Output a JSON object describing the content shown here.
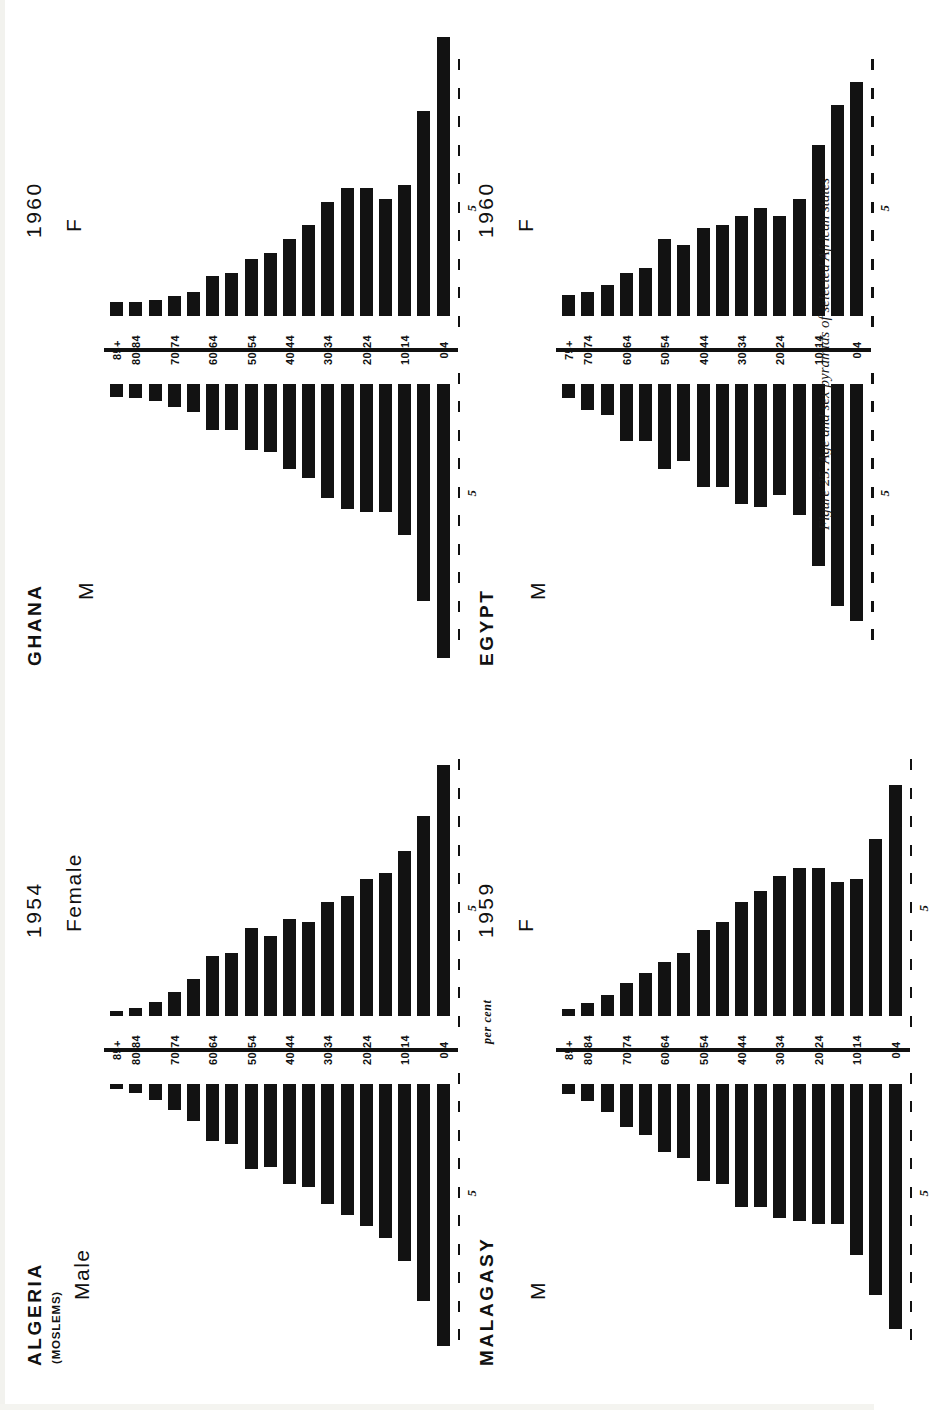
{
  "figure": {
    "caption": "Figure 25.  Age and sex pyramids of selected African states",
    "percent_axis_label": "per cent",
    "tick_label_5": "5"
  },
  "chart_data": [
    {
      "type": "bar",
      "id": "algeria",
      "title": "ALGERIA",
      "subtitle": "(MOSLEMS)",
      "year": "1954",
      "left_sex_label": "Male",
      "right_sex_label": "Female",
      "xlabel": "per cent",
      "ylabel": "",
      "xlim": [
        0,
        10
      ],
      "grid": false,
      "legend": "none",
      "categories": [
        "0-4",
        "5-9",
        "10-14",
        "15-19",
        "20-24",
        "25-29",
        "30-34",
        "35-39",
        "40-44",
        "45-49",
        "50-54",
        "55-59",
        "60-64",
        "65-69",
        "70-74",
        "75-79",
        "80-84",
        "85+"
      ],
      "tick_labels": [
        "0-4",
        "10-14",
        "20-24",
        "30-34",
        "40-44",
        "50-54",
        "60-64",
        "70-74",
        "80-84",
        "85+"
      ],
      "series": [
        {
          "name": "Male",
          "values": [
            9.2,
            7.6,
            6.2,
            5.4,
            5.0,
            4.6,
            4.2,
            3.6,
            3.5,
            2.9,
            3.0,
            2.1,
            2.0,
            1.3,
            0.9,
            0.55,
            0.3,
            0.18
          ]
        },
        {
          "name": "Female",
          "values": [
            8.8,
            7.0,
            5.8,
            5.0,
            4.8,
            4.2,
            4.0,
            3.3,
            3.4,
            2.8,
            3.1,
            2.2,
            2.1,
            1.3,
            0.85,
            0.5,
            0.28,
            0.16
          ]
        }
      ]
    },
    {
      "type": "bar",
      "id": "malagasy",
      "title": "MALAGASY",
      "subtitle": "",
      "year": "1959",
      "left_sex_label": "M",
      "right_sex_label": "F",
      "xlabel": "per cent",
      "ylabel": "",
      "xlim": [
        0,
        10
      ],
      "grid": false,
      "legend": "none",
      "categories": [
        "0-4",
        "5-9",
        "10-14",
        "15-19",
        "20-24",
        "25-29",
        "30-34",
        "35-39",
        "40-44",
        "45-49",
        "50-54",
        "55-59",
        "60-64",
        "65-69",
        "70-74",
        "75-79",
        "80-84",
        "85+"
      ],
      "tick_labels": [
        "0-4",
        "10-14",
        "20-24",
        "30-34",
        "40-44",
        "50-54",
        "60-64",
        "70-74",
        "80-84",
        "85+"
      ],
      "series": [
        {
          "name": "M",
          "values": [
            8.6,
            7.4,
            6.0,
            4.9,
            4.9,
            4.8,
            4.7,
            4.3,
            4.3,
            3.5,
            3.4,
            2.6,
            2.4,
            1.8,
            1.5,
            1.0,
            0.6,
            0.35
          ]
        },
        {
          "name": "F",
          "values": [
            8.1,
            6.2,
            4.8,
            4.7,
            5.2,
            5.2,
            4.9,
            4.4,
            4.0,
            3.3,
            3.0,
            2.2,
            1.9,
            1.5,
            1.15,
            0.75,
            0.45,
            0.25
          ]
        }
      ]
    },
    {
      "type": "bar",
      "id": "ghana",
      "title": "GHANA",
      "subtitle": "",
      "year": "1960",
      "left_sex_label": "M",
      "right_sex_label": "F",
      "xlabel": "per cent",
      "ylabel": "",
      "xlim": [
        0,
        10
      ],
      "grid": false,
      "legend": "none",
      "categories": [
        "0-4",
        "5-9",
        "10-14",
        "15-19",
        "20-24",
        "25-29",
        "30-34",
        "35-39",
        "40-44",
        "45-49",
        "50-54",
        "55-59",
        "60-64",
        "65-69",
        "70-74",
        "75-79",
        "80-84",
        "85+"
      ],
      "tick_labels": [
        "0-4",
        "10-14",
        "20-24",
        "30-34",
        "40-44",
        "50-54",
        "60-64",
        "70-74",
        "80-84",
        "85+"
      ],
      "series": [
        {
          "name": "M",
          "values": [
            9.6,
            7.6,
            5.3,
            4.5,
            4.5,
            4.4,
            4.0,
            3.3,
            3.0,
            2.4,
            2.3,
            1.6,
            1.6,
            1.0,
            0.8,
            0.6,
            0.5,
            0.45
          ]
        },
        {
          "name": "F",
          "values": [
            9.8,
            7.2,
            4.6,
            4.1,
            4.5,
            4.5,
            4.0,
            3.2,
            2.7,
            2.2,
            2.0,
            1.5,
            1.4,
            0.85,
            0.7,
            0.55,
            0.5,
            0.5
          ]
        }
      ]
    },
    {
      "type": "bar",
      "id": "egypt",
      "title": "EGYPT",
      "subtitle": "",
      "year": "1960",
      "left_sex_label": "M",
      "right_sex_label": "F",
      "xlabel": "per cent",
      "ylabel": "",
      "xlim": [
        0,
        10
      ],
      "grid": false,
      "legend": "none",
      "categories": [
        "0-4",
        "5-9",
        "10-14",
        "15-19",
        "20-24",
        "25-29",
        "30-34",
        "35-39",
        "40-44",
        "45-49",
        "50-54",
        "55-59",
        "60-64",
        "65-69",
        "70-74",
        "75+"
      ],
      "tick_labels": [
        "0-4",
        "10-14",
        "20-24",
        "30-34",
        "40-44",
        "50-54",
        "60-64",
        "70-74",
        "75+"
      ],
      "series": [
        {
          "name": "M",
          "values": [
            8.3,
            7.8,
            6.4,
            4.6,
            3.9,
            4.3,
            4.2,
            3.6,
            3.6,
            2.7,
            3.0,
            2.0,
            2.0,
            1.1,
            0.9,
            0.5
          ]
        },
        {
          "name": "F",
          "values": [
            8.2,
            7.4,
            6.0,
            4.1,
            3.5,
            3.8,
            3.5,
            3.2,
            3.1,
            2.5,
            2.7,
            1.7,
            1.5,
            1.1,
            0.85,
            0.75
          ]
        }
      ]
    }
  ]
}
